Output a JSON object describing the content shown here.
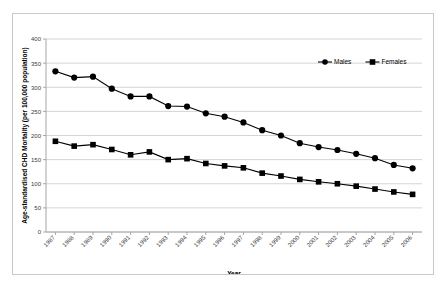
{
  "chart_data": {
    "type": "line",
    "title": "",
    "xlabel": "Year",
    "ylabel": "Age-standardised CHD Mortality (per 100,000 population)",
    "categories": [
      "1987",
      "1988",
      "1989",
      "1990",
      "1991",
      "1992",
      "1993",
      "1994",
      "1995",
      "1996",
      "1997",
      "1998",
      "1999",
      "2000",
      "2001",
      "2002",
      "2003",
      "2004",
      "2005",
      "2006"
    ],
    "x": [
      1987,
      1988,
      1989,
      1990,
      1991,
      1992,
      1993,
      1994,
      1995,
      1996,
      1997,
      1998,
      1999,
      2000,
      2001,
      2002,
      2003,
      2004,
      2005,
      2006
    ],
    "series": [
      {
        "name": "Males",
        "marker": "circle",
        "color": "#000000",
        "values": [
          333,
          320,
          322,
          297,
          281,
          281,
          261,
          260,
          246,
          239,
          227,
          211,
          200,
          184,
          176,
          170,
          162,
          153,
          139,
          132
        ]
      },
      {
        "name": "Females",
        "marker": "square",
        "color": "#000000",
        "values": [
          188,
          178,
          181,
          171,
          160,
          166,
          150,
          152,
          142,
          137,
          133,
          122,
          116,
          109,
          104,
          100,
          95,
          89,
          83,
          78
        ]
      }
    ],
    "ylim": [
      0,
      400
    ],
    "yticks": [
      0,
      50,
      100,
      150,
      200,
      250,
      300,
      350,
      400
    ],
    "ytick_labels": [
      "0",
      "50",
      "100",
      "150",
      "200",
      "250",
      "300",
      "350",
      "400"
    ],
    "grid": true,
    "grid_axis": "y",
    "legend_position": "top-right",
    "legend_entries": [
      "Males",
      "Females"
    ],
    "colors": {
      "series": "#000000",
      "gridline": "#d4d4d4",
      "axis": "#a6a6a6",
      "tick_text": "#3a3a3a",
      "frame_border": "#c9c9c9",
      "background": "#ffffff"
    }
  }
}
